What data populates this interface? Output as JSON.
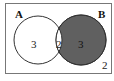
{
  "diagram": {
    "type": "venn",
    "sets": [
      {
        "label": "A",
        "only_count": "3",
        "shaded": false
      },
      {
        "label": "B",
        "only_count": "3",
        "shaded": true
      }
    ],
    "intersection_count": "2",
    "outside_count": "2",
    "shade_color": "#5f5f5f"
  }
}
